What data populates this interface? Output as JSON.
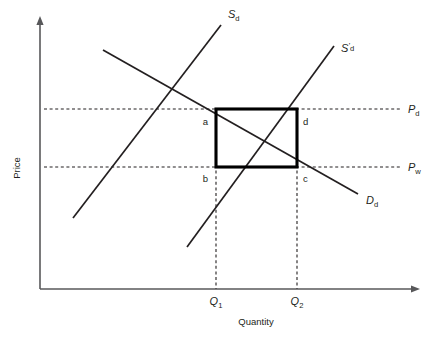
{
  "figure": {
    "type": "economics-supply-demand-diagram",
    "background_color": "#ffffff",
    "line_color": "#231f20",
    "axis_color": "#58585a",
    "box_color": "#000000"
  },
  "axes": {
    "y_title": "Price",
    "x_title": "Quantity",
    "origin": {
      "x": 40,
      "y": 289
    },
    "y_top": {
      "x": 40,
      "y": 16
    },
    "x_right": {
      "x": 420,
      "y": 289
    }
  },
  "curves": [
    {
      "id": "supply-domestic",
      "label_text": "S",
      "label_sub": "d",
      "label_prime": "",
      "label_x": 228,
      "label_y": 18,
      "x1": 73,
      "y1": 218,
      "x2": 221,
      "y2": 25
    },
    {
      "id": "supply-domestic-shifted",
      "label_text": "S",
      "label_sub": "d",
      "label_prime": "'",
      "label_x": 341,
      "label_y": 52,
      "x1": 187,
      "y1": 247,
      "x2": 334,
      "y2": 46
    },
    {
      "id": "demand-domestic",
      "label_text": "D",
      "label_sub": "d",
      "label_prime": "",
      "label_x": 366,
      "label_y": 204,
      "x1": 103,
      "y1": 50,
      "x2": 358,
      "y2": 194
    }
  ],
  "price_lines": [
    {
      "id": "price-domestic",
      "label_text": "P",
      "label_sub": "d",
      "y": 109,
      "x_start": 44,
      "x_end": 400,
      "label_x": 408,
      "label_y": 113
    },
    {
      "id": "price-world",
      "label_text": "P",
      "label_sub": "w",
      "y": 167,
      "x_start": 44,
      "x_end": 400,
      "label_x": 408,
      "label_y": 171
    }
  ],
  "quantity_lines": [
    {
      "id": "quantity-1",
      "label_text": "Q",
      "label_sub": "1",
      "x": 216,
      "y_top": 109,
      "y_bottom": 289,
      "label_x": 216,
      "label_y": 305
    },
    {
      "id": "quantity-2",
      "label_text": "Q",
      "label_sub": "2",
      "x": 297,
      "y_top": 109,
      "y_bottom": 289,
      "label_x": 297,
      "label_y": 305
    }
  ],
  "rectangle": {
    "id": "welfare-box",
    "x": 216,
    "y": 109,
    "width": 81,
    "height": 58
  },
  "corner_labels": [
    {
      "id": "corner-a",
      "text": "a",
      "x": 208,
      "y": 125,
      "anchor": "end"
    },
    {
      "id": "corner-d",
      "text": "d",
      "x": 303,
      "y": 125,
      "anchor": "start"
    },
    {
      "id": "corner-b",
      "text": "b",
      "x": 208,
      "y": 182,
      "anchor": "end"
    },
    {
      "id": "corner-c",
      "text": "c",
      "x": 303,
      "y": 182,
      "anchor": "start"
    }
  ],
  "axis_titles": {
    "y_label_x": 20,
    "y_label_y": 168,
    "x_label_x": 256,
    "x_label_y": 325
  }
}
